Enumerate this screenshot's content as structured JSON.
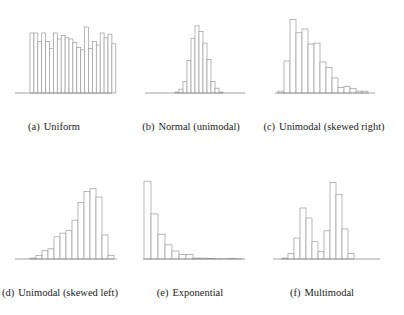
{
  "chart_data": [
    {
      "id": "a",
      "type": "bar",
      "subtype": "histogram",
      "title": "Uniform",
      "label": "(a)",
      "caption": "Uniform",
      "xlabel": "",
      "ylabel": "",
      "grid": false,
      "legend": null,
      "axis_x": [
        15,
        112
      ],
      "baseline_y": 93,
      "bar_x0": 30,
      "bar_width": 3.9,
      "values": [
        50,
        50,
        43,
        50,
        43,
        37,
        50,
        45,
        48,
        46,
        45,
        42,
        38,
        36,
        55,
        37,
        43,
        40,
        50,
        46,
        49,
        41
      ],
      "ylim": [
        0,
        60
      ]
    },
    {
      "id": "b",
      "type": "bar",
      "subtype": "histogram",
      "title": "Normal (unimodal)",
      "label": "(b)",
      "caption": "Normal (unimodal)",
      "xlabel": "",
      "ylabel": "",
      "grid": false,
      "legend": null,
      "axis_x": [
        145,
        245
      ],
      "baseline_y": 93,
      "bar_x0": 175,
      "bar_width": 4,
      "values": [
        1,
        4,
        12,
        34,
        57,
        70,
        64,
        52,
        35,
        12,
        5,
        1
      ],
      "ylim": [
        0,
        75
      ]
    },
    {
      "id": "c",
      "type": "bar",
      "subtype": "histogram",
      "title": "Unimodal (skewed right)",
      "label": "(c)",
      "caption": "Unimodal (skewed right)",
      "xlabel": "",
      "ylabel": "",
      "grid": false,
      "legend": null,
      "axis_x": [
        275,
        375
      ],
      "baseline_y": 93,
      "bar_x0": 278,
      "bar_width": 6,
      "values": [
        2,
        34,
        78,
        64,
        68,
        52,
        53,
        33,
        27,
        16,
        6,
        7,
        5,
        2,
        2
      ],
      "ylim": [
        0,
        85
      ]
    },
    {
      "id": "d",
      "type": "bar",
      "subtype": "histogram",
      "title": "Unimodal (skewed left)",
      "label": "(d)",
      "caption": "Unimodal (skewed left)",
      "xlabel": "",
      "ylabel": "",
      "grid": false,
      "legend": null,
      "axis_x": [
        15,
        117
      ],
      "baseline_y": 259,
      "bar_x0": 30,
      "bar_width": 6,
      "values": [
        1,
        4,
        9,
        11,
        24,
        28,
        31,
        42,
        61,
        73,
        76,
        67,
        26,
        4
      ],
      "ylim": [
        0,
        80
      ]
    },
    {
      "id": "e",
      "type": "bar",
      "subtype": "histogram",
      "title": "Exponential",
      "label": "(e)",
      "caption": "Exponential",
      "xlabel": "",
      "ylabel": "",
      "grid": false,
      "legend": null,
      "axis_x": [
        143,
        245
      ],
      "baseline_y": 259,
      "bar_x0": 144,
      "bar_width": 7,
      "values": [
        88,
        51,
        28,
        16,
        9,
        5,
        5,
        1,
        1,
        0.5,
        0.3,
        0.2,
        0.5,
        0.3
      ],
      "ylim": [
        0,
        95
      ]
    },
    {
      "id": "f",
      "type": "bar",
      "subtype": "histogram",
      "title": "Multimodal",
      "label": "(f)",
      "caption": "Multimodal",
      "xlabel": "",
      "ylabel": "",
      "grid": false,
      "legend": null,
      "axis_x": [
        273,
        380
      ],
      "baseline_y": 259,
      "bar_x0": 282,
      "bar_width": 6,
      "values": [
        1,
        6,
        23,
        56,
        45,
        19,
        8,
        31,
        84,
        71,
        33,
        6
      ],
      "ylim": [
        0,
        90
      ]
    }
  ],
  "captions": [
    {
      "tag": "(a)",
      "text": "Uniform",
      "x": 54,
      "y": 121
    },
    {
      "tag": "(b)",
      "text": "Normal (unimodal)",
      "x": 191,
      "y": 121
    },
    {
      "tag": "(c)",
      "text": "Unimodal (skewed right)",
      "x": 324,
      "y": 121
    },
    {
      "tag": "(d)",
      "text": "Unimodal (skewed left)",
      "x": 60,
      "y": 287
    },
    {
      "tag": "(e)",
      "text": "Exponential",
      "x": 190,
      "y": 287
    },
    {
      "tag": "(f)",
      "text": "Multimodal",
      "x": 322,
      "y": 287
    }
  ],
  "style": {
    "bar_stroke": "#9a9a9a",
    "bar_fill": "#ffffff",
    "axis_stroke": "#8a8a8a"
  }
}
